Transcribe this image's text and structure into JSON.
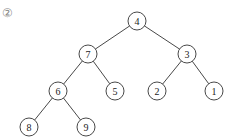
{
  "figure_label": "②",
  "tree": {
    "radius": 9,
    "nodes": [
      {
        "id": "n4",
        "value": "4",
        "x": 137,
        "y": 21
      },
      {
        "id": "n7",
        "value": "7",
        "x": 88,
        "y": 54
      },
      {
        "id": "n3",
        "value": "3",
        "x": 187,
        "y": 54
      },
      {
        "id": "n6",
        "value": "6",
        "x": 58,
        "y": 91
      },
      {
        "id": "n5",
        "value": "5",
        "x": 115,
        "y": 91
      },
      {
        "id": "n2",
        "value": "2",
        "x": 157,
        "y": 91
      },
      {
        "id": "n1",
        "value": "1",
        "x": 214,
        "y": 91
      },
      {
        "id": "n8",
        "value": "8",
        "x": 29,
        "y": 127
      },
      {
        "id": "n9",
        "value": "9",
        "x": 86,
        "y": 127
      }
    ],
    "edges": [
      [
        "n4",
        "n7"
      ],
      [
        "n4",
        "n3"
      ],
      [
        "n7",
        "n6"
      ],
      [
        "n7",
        "n5"
      ],
      [
        "n3",
        "n2"
      ],
      [
        "n3",
        "n1"
      ],
      [
        "n6",
        "n8"
      ],
      [
        "n6",
        "n9"
      ]
    ]
  }
}
